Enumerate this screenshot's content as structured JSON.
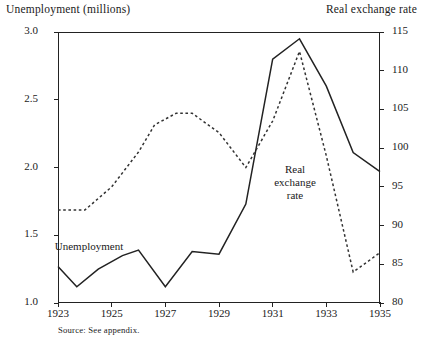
{
  "titles": {
    "left_axis": "Unemployment (millions)",
    "right_axis": "Real exchange rate"
  },
  "source_note": "Source: See appendix.",
  "inline_labels": {
    "unemployment": "Unemployment",
    "real_exchange_rate_l1": "Real",
    "real_exchange_rate_l2": "exchange",
    "real_exchange_rate_l3": "rate"
  },
  "axes": {
    "left_ticks": [
      "1.0",
      "1.5",
      "2.0",
      "2.5",
      "3.0"
    ],
    "right_ticks": [
      "80",
      "85",
      "90",
      "95",
      "100",
      "105",
      "110",
      "115"
    ],
    "x_ticks": [
      "1923",
      "1925",
      "1927",
      "1929",
      "1931",
      "1933",
      "1935"
    ]
  },
  "chart_data": {
    "type": "line",
    "title": "",
    "xlabel": "",
    "ylabel": "Unemployment (millions)",
    "y2label": "Real exchange rate",
    "x": [
      1923,
      1924,
      1925,
      1926,
      1927,
      1928,
      1929,
      1930,
      1931,
      1932,
      1933,
      1934,
      1935
    ],
    "xlim": [
      1923,
      1935
    ],
    "ylim": [
      1.0,
      3.0
    ],
    "y2lim": [
      80,
      115
    ],
    "grid": false,
    "legend": "inline-annotations",
    "series": [
      {
        "name": "Unemployment",
        "axis": "left",
        "style": "solid",
        "color": "#222222",
        "x": [
          1923,
          1923.7,
          1924.5,
          1925.4,
          1926,
          1927,
          1928,
          1929,
          1930,
          1931,
          1932,
          1933,
          1934,
          1935
        ],
        "values": [
          1.27,
          1.12,
          1.25,
          1.35,
          1.39,
          1.12,
          1.38,
          1.36,
          1.73,
          2.8,
          2.95,
          2.6,
          2.11,
          1.97
        ]
      },
      {
        "name": "Real exchange rate",
        "axis": "right",
        "style": "dashed",
        "color": "#333333",
        "x": [
          1923,
          1924,
          1925,
          1926,
          1926.6,
          1927.4,
          1928,
          1929,
          1930,
          1931,
          1932,
          1933,
          1934,
          1935
        ],
        "values": [
          92.0,
          92.0,
          95.0,
          99.5,
          103.0,
          104.5,
          104.5,
          102.0,
          97.5,
          103.5,
          112.5,
          99.0,
          84.0,
          86.5
        ]
      }
    ]
  }
}
